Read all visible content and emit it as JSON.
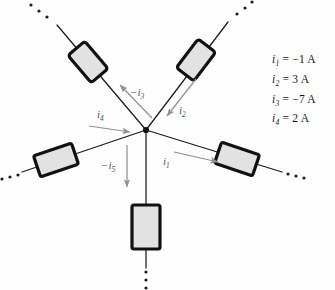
{
  "figure": {
    "type": "circuit-node-diagram",
    "background_color": "#fefefe",
    "wire_color": "#1c1c1c",
    "arrow_color": "#8d9296",
    "resistor_fill": "#e2e2e2",
    "resistor_stroke": "#111111",
    "node_color": "#111111"
  },
  "node": {
    "label": "junction",
    "x": 146,
    "y": 130
  },
  "branches": [
    {
      "id": "branch-1",
      "direction": "right",
      "current_label": "i",
      "current_sub": "1",
      "current_text": "i1",
      "arrow_direction": "away-from-node",
      "angle_deg": 20
    },
    {
      "id": "branch-2",
      "direction": "upper-right",
      "current_label": "i",
      "current_sub": "2",
      "current_text": "i2",
      "arrow_direction": "toward-node",
      "angle_deg": -58
    },
    {
      "id": "branch-3",
      "direction": "upper-left",
      "current_label": "-i",
      "current_sub": "3",
      "current_text": "-i3",
      "arrow_direction": "away-from-node",
      "angle_deg": -122
    },
    {
      "id": "branch-4",
      "direction": "left",
      "current_label": "i",
      "current_sub": "4",
      "current_text": "i4",
      "arrow_direction": "toward-node",
      "angle_deg": 164
    },
    {
      "id": "branch-5",
      "direction": "down",
      "current_label": "-i",
      "current_sub": "5",
      "current_text": "-i5",
      "arrow_direction": "away-from-node",
      "angle_deg": 90
    }
  ],
  "current_labels": {
    "i1": {
      "prefix": "i",
      "sub": "1"
    },
    "i2": {
      "prefix": "i",
      "sub": "2"
    },
    "i3": {
      "prefix": "−i",
      "sub": "3"
    },
    "i4": {
      "prefix": "i",
      "sub": "4"
    },
    "i5": {
      "prefix": "−i",
      "sub": "5"
    }
  },
  "legend": {
    "items": [
      {
        "var": "i",
        "sub": "1",
        "eq": "=",
        "value": "−1",
        "unit": "A",
        "full": "i1 = −1 A"
      },
      {
        "var": "i",
        "sub": "2",
        "eq": "=",
        "value": "3",
        "unit": "A",
        "full": "i2 = 3 A"
      },
      {
        "var": "i",
        "sub": "3",
        "eq": "=",
        "value": "−7",
        "unit": "A",
        "full": "i3 = −7 A"
      },
      {
        "var": "i",
        "sub": "4",
        "eq": "=",
        "value": "2",
        "unit": "A",
        "full": "i4 = 2 A"
      }
    ]
  },
  "ellipses": [
    {
      "id": "ellipsis-upper-left",
      "dots": 3
    },
    {
      "id": "ellipsis-upper-right",
      "dots": 3
    },
    {
      "id": "ellipsis-left",
      "dots": 3
    },
    {
      "id": "ellipsis-right",
      "dots": 3
    },
    {
      "id": "ellipsis-bottom",
      "dots": 3
    }
  ]
}
